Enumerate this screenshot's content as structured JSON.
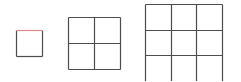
{
  "diagram": {
    "title": "",
    "line_color": "#4d4d4d",
    "highlight_color": "#e08a8a",
    "background": "#ffffff",
    "grids": [
      {
        "name": "grid-1x1",
        "cells": 1,
        "x": 16,
        "y": 30,
        "size": 26,
        "highlight_top_edge": true
      },
      {
        "name": "grid-2x2",
        "cells": 2,
        "x": 68,
        "y": 17,
        "size": 52,
        "highlight_top_edge": false
      },
      {
        "name": "grid-3x3",
        "cells": 3,
        "x": 145,
        "y": 4,
        "size": 77,
        "highlight_top_edge": false
      }
    ]
  }
}
